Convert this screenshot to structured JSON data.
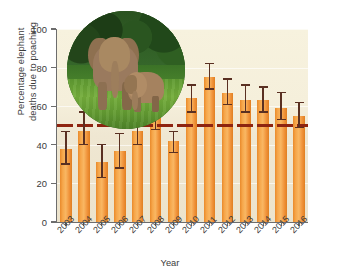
{
  "chart_data": {
    "type": "bar",
    "title": "",
    "xlabel": "Year",
    "ylabel": "Percentage elephant deaths due to poaching",
    "ylim": [
      0,
      100
    ],
    "yticks": [
      0,
      20,
      40,
      60,
      80,
      100
    ],
    "grid": true,
    "legend": "none",
    "categories": [
      "2003",
      "2004",
      "2005",
      "2006",
      "2007",
      "2008",
      "2009",
      "2010",
      "2011",
      "2012",
      "2013",
      "2014",
      "2015",
      "2016"
    ],
    "values": [
      38,
      47,
      31,
      37,
      47,
      57,
      42,
      64,
      75,
      67,
      63,
      63,
      59,
      55
    ],
    "error_low": [
      30,
      40,
      23,
      28,
      40,
      48,
      36,
      57,
      69,
      61,
      57,
      57,
      53,
      49
    ],
    "error_high": [
      47,
      57,
      40,
      46,
      57,
      65,
      47,
      71,
      82,
      74,
      71,
      70,
      67,
      62
    ],
    "series": [
      {
        "name": "Percentage elephant deaths due to poaching",
        "values": [
          38,
          47,
          31,
          37,
          47,
          57,
          42,
          64,
          75,
          67,
          63,
          63,
          59,
          55
        ]
      }
    ],
    "reference_line": {
      "value": 50,
      "style": "dashed",
      "color": "#8e2410",
      "label": ""
    },
    "bar_color": "#f0a040",
    "panel_color": "#f5efdb",
    "errorbar_color": "#5a3022"
  },
  "inset": {
    "caption": "",
    "description": "elephant-photo"
  },
  "axes": {
    "x_title": "Year",
    "y_title_line1": "Percentage elephant",
    "y_title_line2": "deaths due to poaching",
    "y_ticks": [
      "0",
      "20",
      "40",
      "60",
      "80",
      "100"
    ],
    "x_ticks": [
      "2003",
      "2004",
      "2005",
      "2006",
      "2007",
      "2008",
      "2009",
      "2010",
      "2011",
      "2012",
      "2013",
      "2014",
      "2015",
      "2016"
    ]
  }
}
